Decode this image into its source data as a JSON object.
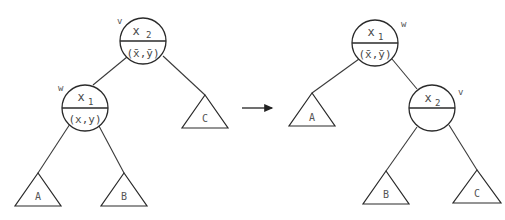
{
  "diagram": {
    "title": "",
    "transformation_arrow": "right-rotation",
    "before": {
      "nodes": {
        "v": {
          "tag": "v",
          "key_base": "x",
          "key_sub": "2",
          "pair": "(x̄,ȳ)"
        },
        "w": {
          "tag": "w",
          "key_base": "x",
          "key_sub": "1",
          "pair": "(x,y)"
        }
      },
      "subtrees": {
        "A": "A",
        "B": "B",
        "C": "C"
      },
      "edges": [
        [
          "v",
          "w"
        ],
        [
          "v",
          "C"
        ],
        [
          "w",
          "A"
        ],
        [
          "w",
          "B"
        ]
      ]
    },
    "after": {
      "nodes": {
        "w": {
          "tag": "w",
          "key_base": "x",
          "key_sub": "1",
          "pair": "(x̄,ȳ)"
        },
        "v": {
          "tag": "v",
          "key_base": "x",
          "key_sub": "2",
          "pair": ""
        }
      },
      "subtrees": {
        "A": "A",
        "B": "B",
        "C": "C"
      },
      "edges": [
        [
          "w",
          "A"
        ],
        [
          "w",
          "v"
        ],
        [
          "v",
          "B"
        ],
        [
          "v",
          "C"
        ]
      ]
    }
  }
}
